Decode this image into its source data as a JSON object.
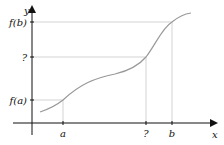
{
  "diagram": {
    "type": "function-graph",
    "axes": {
      "x_label": "x",
      "y_label": "y"
    },
    "x_ticks": [
      {
        "label": "a",
        "x": 63
      },
      {
        "label": "?",
        "x": 146
      },
      {
        "label": "b",
        "x": 172
      }
    ],
    "y_ticks": [
      {
        "label": "f(b)",
        "y": 22
      },
      {
        "label": "?",
        "y": 57
      },
      {
        "label": "f(a)",
        "y": 100
      }
    ],
    "colors": {
      "axis": "#111111",
      "curve": "#999999",
      "guide": "#c8c8c8"
    }
  }
}
